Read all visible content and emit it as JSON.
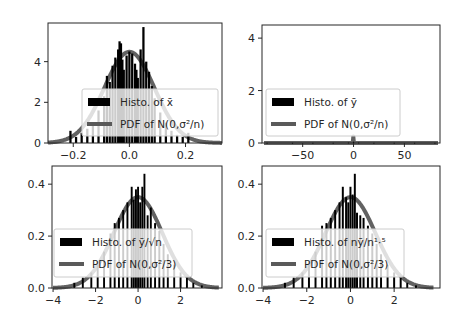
{
  "figure": {
    "width": 459,
    "height": 324,
    "background": "#ffffff",
    "colors": {
      "histogram": "#000000",
      "pdf_line": "#5a5a5a",
      "axis": "#262626",
      "legend_border": "#cccccc"
    }
  },
  "chart_data": [
    {
      "type": "bar",
      "panel": "top-left",
      "title": "",
      "xlabel": "",
      "ylabel": "",
      "xlim": [
        -0.29,
        0.33
      ],
      "ylim": [
        0,
        5.9
      ],
      "xticks": [
        -0.2,
        0.0,
        0.2
      ],
      "xtick_labels": [
        "−0.2",
        "0.0",
        "0.2"
      ],
      "yticks": [
        0,
        2,
        4
      ],
      "ytick_labels": [
        "0",
        "2",
        "4"
      ],
      "grid": false,
      "legend": {
        "position": "lower center",
        "entries": [
          {
            "label": "Histo. of x̄",
            "kind": "bar"
          },
          {
            "label": "PDF of N(0,σ²/n)",
            "kind": "line"
          }
        ]
      },
      "series": [
        {
          "name": "Histo. of x̄",
          "kind": "histogram",
          "bin_width": 0.008,
          "x": [
            -0.21,
            -0.19,
            -0.17,
            -0.15,
            -0.13,
            -0.11,
            -0.09,
            -0.08,
            -0.07,
            -0.06,
            -0.05,
            -0.04,
            -0.035,
            -0.03,
            -0.025,
            -0.02,
            -0.01,
            0.0,
            0.01,
            0.02,
            0.025,
            0.03,
            0.04,
            0.05,
            0.06,
            0.07,
            0.08,
            0.09,
            0.11,
            0.13,
            0.15,
            0.17,
            0.19,
            0.21
          ],
          "values": [
            0.6,
            0.3,
            0.5,
            0.7,
            1.0,
            1.6,
            2.3,
            3.3,
            3.0,
            3.8,
            4.2,
            4.6,
            5.0,
            4.9,
            4.1,
            3.6,
            4.3,
            4.5,
            4.4,
            3.9,
            3.6,
            3.2,
            4.6,
            5.7,
            4.0,
            3.5,
            2.8,
            2.2,
            1.5,
            1.0,
            0.6,
            0.4,
            0.3,
            0.5
          ]
        },
        {
          "name": "PDF of N(0,σ²/n)",
          "kind": "normal_pdf",
          "mean": 0,
          "std": 0.089,
          "x_range": [
            -0.29,
            0.33
          ]
        }
      ]
    },
    {
      "type": "bar",
      "panel": "top-right",
      "title": "",
      "xlabel": "",
      "ylabel": "",
      "xlim": [
        -90,
        85
      ],
      "ylim": [
        0,
        4.5
      ],
      "xticks": [
        -50,
        0,
        50
      ],
      "xtick_labels": [
        "−50",
        "0",
        "50"
      ],
      "yticks": [
        0,
        2,
        4
      ],
      "ytick_labels": [
        "0",
        "2",
        "4"
      ],
      "grid": false,
      "legend": {
        "position": "lower center",
        "entries": [
          {
            "label": "Histo. of ȳ",
            "kind": "bar"
          },
          {
            "label": "PDF of N(0,σ²/n)",
            "kind": "line"
          }
        ]
      },
      "series": [
        {
          "name": "Histo. of ȳ",
          "kind": "histogram",
          "bin_width": 1.0,
          "x": [
            -85,
            -60,
            -40,
            -20,
            -5,
            0,
            5,
            20,
            40,
            60,
            80
          ],
          "values": [
            0.01,
            0.01,
            0.01,
            0.01,
            0.02,
            0.05,
            0.02,
            0.01,
            0.01,
            0.01,
            0.01
          ]
        },
        {
          "name": "PDF of N(0,σ²/n)",
          "kind": "normal_pdf",
          "mean": 0,
          "std": 0.092,
          "x_range": [
            -88,
            83
          ]
        }
      ]
    },
    {
      "type": "bar",
      "panel": "bottom-left",
      "title": "",
      "xlabel": "",
      "ylabel": "",
      "xlim": [
        -4.05,
        3.95
      ],
      "ylim": [
        0,
        0.47
      ],
      "xticks": [
        -4,
        -2,
        0,
        2
      ],
      "xtick_labels": [
        "−4",
        "−2",
        "0",
        "2"
      ],
      "yticks": [
        0.0,
        0.2,
        0.4
      ],
      "ytick_labels": [
        "0.0",
        "0.2",
        "0.4"
      ],
      "grid": false,
      "legend": {
        "position": "lower center",
        "entries": [
          {
            "label": "Histo. of ȳ/√n",
            "kind": "bar"
          },
          {
            "label": "PDF of N(0,σ²/3)",
            "kind": "line"
          }
        ]
      },
      "series": [
        {
          "name": "Histo. of ȳ/√n",
          "kind": "histogram",
          "bin_width": 0.09,
          "x": [
            -3.0,
            -2.6,
            -2.2,
            -1.9,
            -1.6,
            -1.3,
            -1.1,
            -0.9,
            -0.7,
            -0.5,
            -0.3,
            -0.2,
            -0.1,
            0.0,
            0.1,
            0.2,
            0.3,
            0.45,
            0.6,
            0.8,
            1.0,
            1.2,
            1.4,
            1.7,
            2.0,
            2.3,
            2.6,
            3.0
          ],
          "values": [
            0.02,
            0.04,
            0.06,
            0.09,
            0.14,
            0.21,
            0.25,
            0.27,
            0.3,
            0.33,
            0.39,
            0.34,
            0.38,
            0.39,
            0.33,
            0.39,
            0.44,
            0.28,
            0.31,
            0.25,
            0.22,
            0.17,
            0.13,
            0.09,
            0.06,
            0.04,
            0.02,
            0.01
          ]
        },
        {
          "name": "PDF of N(0,σ²/3)",
          "kind": "normal_pdf",
          "mean": 0,
          "std": 1.14,
          "x_range": [
            -4.0,
            3.8
          ]
        }
      ]
    },
    {
      "type": "bar",
      "panel": "bottom-right",
      "title": "",
      "xlabel": "",
      "ylabel": "",
      "xlim": [
        -4.05,
        4.1
      ],
      "ylim": [
        0,
        0.47
      ],
      "xticks": [
        -4,
        -2,
        0,
        2
      ],
      "xtick_labels": [
        "−4",
        "−2",
        "0",
        "2"
      ],
      "yticks": [
        0.0,
        0.2,
        0.4
      ],
      "ytick_labels": [
        "0.0",
        "0.2",
        "0.4"
      ],
      "grid": false,
      "legend": {
        "position": "lower center",
        "entries": [
          {
            "label": "Histo. of nȳ/n¹·⁵",
            "kind": "bar"
          },
          {
            "label": "PDF of N(0,σ²/3)",
            "kind": "line"
          }
        ]
      },
      "series": [
        {
          "name": "Histo. of nȳ/n¹·⁵",
          "kind": "histogram",
          "bin_width": 0.09,
          "x": [
            -3.0,
            -2.6,
            -2.2,
            -1.9,
            -1.6,
            -1.3,
            -1.1,
            -0.9,
            -0.7,
            -0.5,
            -0.35,
            -0.2,
            -0.1,
            0.0,
            0.1,
            0.2,
            0.3,
            0.45,
            0.6,
            0.8,
            1.0,
            1.2,
            1.4,
            1.7,
            2.0,
            2.3,
            2.6,
            3.0
          ],
          "values": [
            0.02,
            0.04,
            0.06,
            0.09,
            0.14,
            0.24,
            0.25,
            0.27,
            0.3,
            0.33,
            0.39,
            0.35,
            0.33,
            0.39,
            0.36,
            0.44,
            0.29,
            0.28,
            0.27,
            0.24,
            0.21,
            0.17,
            0.13,
            0.09,
            0.06,
            0.04,
            0.02,
            0.01
          ]
        },
        {
          "name": "PDF of N(0,σ²/3)",
          "kind": "normal_pdf",
          "mean": 0,
          "std": 1.14,
          "x_range": [
            -4.0,
            3.8
          ]
        }
      ]
    }
  ],
  "layout": {
    "panels": [
      {
        "left": 48,
        "top": 23,
        "right": 222,
        "bottom": 143,
        "legend": {
          "x": 82,
          "y": 89,
          "w": 136,
          "h": 47
        }
      },
      {
        "left": 262,
        "top": 25,
        "right": 440,
        "bottom": 143,
        "legend": {
          "x": 266,
          "y": 89,
          "w": 134,
          "h": 47
        }
      },
      {
        "left": 52,
        "top": 166,
        "right": 222,
        "bottom": 288,
        "legend": {
          "x": 54,
          "y": 229,
          "w": 138,
          "h": 48
        }
      },
      {
        "left": 262,
        "top": 166,
        "right": 440,
        "bottom": 288,
        "legend": {
          "x": 266,
          "y": 229,
          "w": 138,
          "h": 48
        }
      }
    ]
  }
}
